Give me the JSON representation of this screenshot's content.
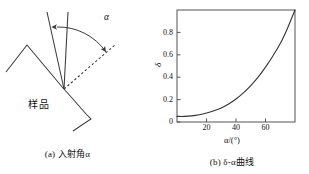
{
  "figure": {
    "background_color": "#ffffff",
    "line_color": "#3a3a3a",
    "text_color": "#111111"
  },
  "panel_a": {
    "caption": "(a) 入射角α",
    "sample_label": "样品",
    "angle_label": "α",
    "description_icons": {
      "incident_ray": "incident-ray-icon",
      "normal_ray": "normal-ray-icon",
      "dashed_ray": "dashed-reference-ray-icon",
      "arc_arrow": "double-arrow-arc-icon",
      "sawtooth_surface": "sawtooth-surface-icon"
    }
  },
  "panel_b": {
    "caption": "(b) δ-α曲线",
    "ylabel": "δ",
    "xlabel": "α/(°)"
  },
  "chart_data": {
    "type": "line",
    "title": "(b) δ-α曲线",
    "xlabel": "α/(°)",
    "ylabel": "δ",
    "xlim": [
      0,
      80
    ],
    "ylim": [
      0,
      1.0
    ],
    "xticks": [
      20,
      40,
      60
    ],
    "yticks": [
      0,
      0.2,
      0.4,
      0.6,
      0.8
    ],
    "xtick_labels": [
      "20",
      "40",
      "60"
    ],
    "ytick_labels": [
      "0",
      "0.2",
      "0.4",
      "0.6",
      "0.8"
    ],
    "grid": false,
    "legend": false,
    "series": [
      {
        "name": "δ-α",
        "x": [
          0,
          5,
          10,
          15,
          20,
          25,
          30,
          35,
          40,
          45,
          50,
          55,
          60,
          65,
          70,
          75,
          80
        ],
        "y": [
          0.05,
          0.05,
          0.055,
          0.065,
          0.08,
          0.1,
          0.125,
          0.16,
          0.205,
          0.26,
          0.325,
          0.4,
          0.49,
          0.59,
          0.7,
          0.84,
          1.0
        ]
      }
    ]
  }
}
